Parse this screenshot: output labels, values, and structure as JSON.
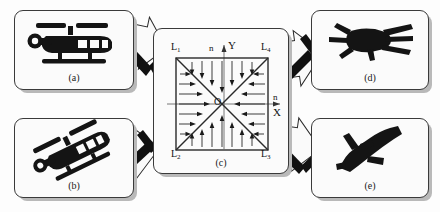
{
  "figure": {
    "type": "schematic-diagram",
    "background_color": "#fdfdfd",
    "card_border_color": "#3a3a3a",
    "card_fill_color": "#fbfbfb",
    "shadow_color": "#b9b9b9",
    "silhouette_color": "#1a1a1a"
  },
  "panels": [
    {
      "id": "a",
      "label": "(a)",
      "icon": "helicopter-side-icon",
      "description": "Side-view helicopter silhouette",
      "position": "top-left"
    },
    {
      "id": "b",
      "label": "(b)",
      "icon": "helicopter-tilted-icon",
      "description": "Tilted helicopter silhouette",
      "position": "bottom-left"
    },
    {
      "id": "c",
      "label": "(c)",
      "icon": "vector-field-square-icon",
      "description": "Square region with diagonals and inward-pointing normal vectors",
      "position": "center"
    },
    {
      "id": "d",
      "label": "(d)",
      "icon": "aircraft-front-icon",
      "description": "Dark front-view aircraft silhouette",
      "position": "top-right"
    },
    {
      "id": "e",
      "label": "(e)",
      "icon": "aircraft-diagonal-icon",
      "description": "Dark diagonal aircraft silhouette",
      "position": "bottom-right"
    }
  ],
  "diagram": {
    "corner_labels": [
      {
        "key": "L1",
        "base": "L",
        "sub": "1",
        "corner": "top-left"
      },
      {
        "key": "L4",
        "base": "L",
        "sub": "4",
        "corner": "top-right"
      },
      {
        "key": "L2",
        "base": "L",
        "sub": "2",
        "corner": "bottom-left"
      },
      {
        "key": "L3",
        "base": "L",
        "sub": "3",
        "corner": "bottom-right"
      }
    ],
    "axes": {
      "x_label": "X",
      "y_label": "Y",
      "origin_label": "O"
    },
    "normal_labels": [
      {
        "key": "n_top",
        "text": "n",
        "position": "top"
      },
      {
        "key": "n_right",
        "text": "n",
        "position": "right"
      }
    ],
    "vector_directions": {
      "top_region": "down",
      "bottom_region": "up",
      "left_region": "right",
      "right_region": "left"
    },
    "arrow_rows_per_region": 5,
    "square_stroke": "#2a2a2a"
  },
  "flow_arrows": [
    {
      "key": "a-to-c",
      "from": "a",
      "to": "c",
      "direction": "down-right"
    },
    {
      "key": "b-to-c",
      "from": "b",
      "to": "c",
      "direction": "up-right"
    },
    {
      "key": "c-to-d",
      "from": "c",
      "to": "d",
      "direction": "up-right"
    },
    {
      "key": "c-to-e",
      "from": "c",
      "to": "e",
      "direction": "down-right"
    }
  ]
}
